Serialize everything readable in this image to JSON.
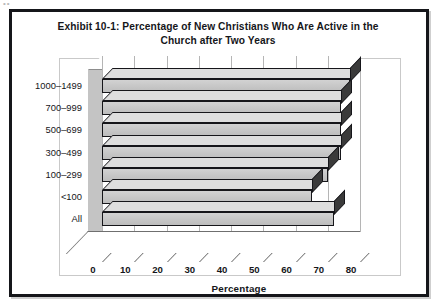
{
  "figure": {
    "title_line1": "Exhibit 10-1: Percentage of New Christians Who Are Active in the",
    "title_line2": "Church after Two Years",
    "scan_artifact": "••"
  },
  "chart_data": {
    "type": "bar",
    "orientation": "horizontal",
    "style": "3d",
    "title": "Exhibit 10-1: Percentage of New Christians Who Are Active in the Church after Two Years",
    "xlabel": "Percentage",
    "ylabel": "Average Attendance",
    "xlim": [
      0,
      80
    ],
    "xticks": [
      "0",
      "10",
      "20",
      "30",
      "40",
      "50",
      "60",
      "70",
      "80"
    ],
    "grid": true,
    "legend": "none",
    "categories": [
      "All",
      "<100",
      "100–299",
      "300–499",
      "500–699",
      "700–999",
      "1000–1499"
    ],
    "values": [
      72,
      65,
      70,
      74,
      74,
      74,
      77
    ],
    "bars": [
      {
        "label": "1000–1499",
        "value": 77
      },
      {
        "label": "700–999",
        "value": 74
      },
      {
        "label": "500–699",
        "value": 74
      },
      {
        "label": "300–499",
        "value": 74
      },
      {
        "label": "100–299",
        "value": 70
      },
      {
        "label": "<100",
        "value": 65
      },
      {
        "label": "All",
        "value": 72
      }
    ],
    "colors": {
      "bar_face": "#c6c6c6",
      "bar_top": "#dedede",
      "bar_cap": "#3a3a3a",
      "outline": "#16161a",
      "sidewall": "#c4c4c4",
      "grid": "#b5b5b5",
      "frame": "#c9c9c9"
    }
  }
}
